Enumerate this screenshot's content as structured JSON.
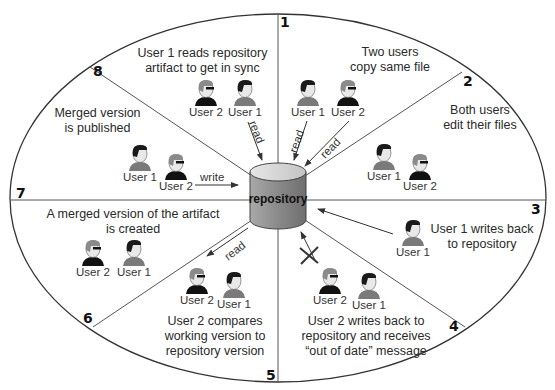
{
  "diagram": {
    "type": "cyclic-process",
    "center": {
      "label": "repository"
    },
    "steps": [
      {
        "number": "1",
        "caption": [
          "Two users",
          "copy same file"
        ],
        "users": [
          "User 1",
          "User 2"
        ],
        "edges": [
          "read",
          "read"
        ]
      },
      {
        "number": "2",
        "caption": [
          "Both users",
          "edit their files"
        ],
        "users": [
          "User 1",
          "User 2"
        ]
      },
      {
        "number": "3",
        "caption": [
          "User 1 writes back",
          "to repository"
        ],
        "users": [
          "User 1"
        ]
      },
      {
        "number": "4",
        "caption": [
          "User 2 writes back to",
          "repository and receives",
          "“out of date” message"
        ],
        "users": [
          "User 2",
          "User 1"
        ]
      },
      {
        "number": "5",
        "caption": [
          "User 2 compares",
          "working version to",
          "repository version"
        ],
        "users": [
          "User 2",
          "User 1"
        ],
        "edges": [
          "read"
        ]
      },
      {
        "number": "6",
        "caption": [
          "A merged version of the artifact",
          "is created"
        ],
        "users": [
          "User 2",
          "User 1"
        ]
      },
      {
        "number": "7",
        "caption": [
          "Merged version",
          "is published"
        ],
        "users": [
          "User 1",
          "User 2"
        ],
        "edges": [
          "write"
        ]
      },
      {
        "number": "8",
        "caption": [
          "User 1 reads repository",
          "artifact to get in sync"
        ],
        "users": [
          "User 2",
          "User 1"
        ],
        "edges": [
          "read"
        ]
      }
    ]
  },
  "labels": {
    "read": "read",
    "write": "write",
    "user1": "User 1",
    "user2": "User 2"
  },
  "colors": {
    "line": "#333333",
    "repo_top": "#d8d8d8",
    "repo_side": "#8c8c8c",
    "user1_hair": "#1a1a1a",
    "user1_shirt": "#7a7a7a",
    "user2_hair": "#8a8a8a",
    "user2_shirt": "#111111",
    "skin": "#e6e6e6"
  }
}
